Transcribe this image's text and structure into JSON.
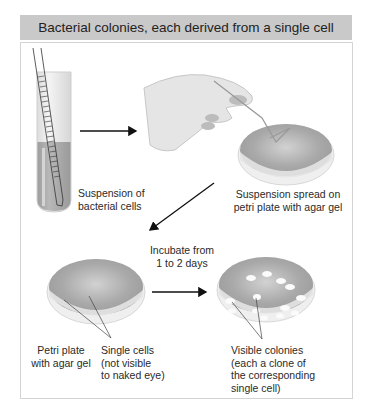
{
  "title": "Bacterial colonies, each derived from a single cell",
  "steps": {
    "tube": {
      "label": "Suspension of bacterial cells",
      "lines": [
        "Suspension of",
        "bacterial cells"
      ]
    },
    "spread": {
      "label": "Suspension spread on petri plate with agar gel",
      "lines": [
        "Suspension spread on",
        "petri plate with agar gel"
      ]
    },
    "incubate": {
      "label": "Incubate from 1 to 2 days",
      "lines": [
        "Incubate from",
        "1 to 2 days"
      ]
    },
    "plate": {
      "label": "Petri plate with agar gel",
      "lines": [
        "Petri plate",
        "with agar gel"
      ]
    },
    "cells": {
      "label": "Single cells (not visible to naked eye)",
      "lines": [
        "Single cells",
        "(not visible",
        "to naked eye)"
      ]
    },
    "colonies": {
      "label": "Visible colonies (each a clone of the corresponding single cell)",
      "lines": [
        "Visible colonies",
        "(each a clone of",
        "the corresponding",
        "single cell)"
      ]
    }
  },
  "colors": {
    "header_bg": "#c9c9c9",
    "agar": "#a9a9a9",
    "plate_rim": "#e6e6e6",
    "colony": "#ffffff",
    "arrow": "#111111"
  }
}
